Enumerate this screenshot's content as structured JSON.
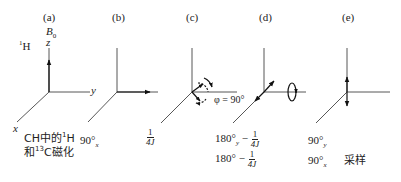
{
  "panels": [
    {
      "id": "a",
      "label": "(a)",
      "field_label": "B",
      "field_sub": "0",
      "z_label": "z",
      "y_label": "y",
      "x_label": "x",
      "nucleus_sup": "1",
      "nucleus": "H",
      "caption_line1_pre": "CH中的",
      "caption_line1_sup": "1",
      "caption_line1_post": "H",
      "caption_line2_pre": "和",
      "caption_line2_sup": "13",
      "caption_line2_post": "C磁化"
    },
    {
      "id": "b",
      "label": "(b)",
      "pulse": "90°",
      "pulse_sub": "x"
    },
    {
      "id": "c",
      "label": "(c)",
      "delay_num": "1",
      "delay_den": "4J",
      "phase_label": "φ = 90°"
    },
    {
      "id": "d",
      "label": "(d)",
      "line1_pulse": "180°",
      "line1_sub": "y",
      "line1_sep": " − ",
      "line1_num": "1",
      "line1_den": "4J",
      "line2_pulse": "180°",
      "line2_sep": " − ",
      "line2_num": "1",
      "line2_den": "4J"
    },
    {
      "id": "e",
      "label": "(e)",
      "line1_pulse": "90°",
      "line1_sub": "y",
      "line2_pulse": "90°",
      "line2_sub": "x",
      "acquire": "采样"
    }
  ]
}
